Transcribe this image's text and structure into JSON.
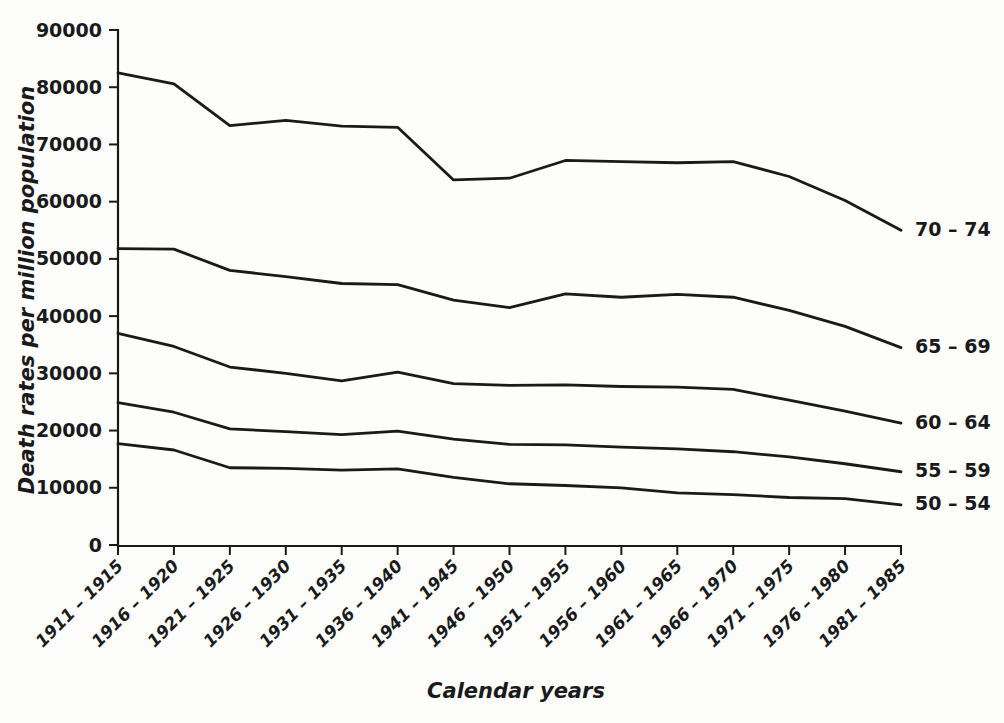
{
  "chart_data": {
    "type": "line",
    "title": "",
    "xlabel": "Calendar years",
    "ylabel": "Death rates per million population",
    "categories": [
      "1911 – 1915",
      "1916 – 1920",
      "1921 – 1925",
      "1926 – 1930",
      "1931 – 1935",
      "1936 – 1940",
      "1941 – 1945",
      "1946 – 1950",
      "1951 – 1955",
      "1956 – 1960",
      "1961 – 1965",
      "1966 – 1970",
      "1971 – 1975",
      "1976 – 1980",
      "1981 – 1985"
    ],
    "ylim": [
      0,
      90000
    ],
    "yticks": [
      0,
      10000,
      20000,
      30000,
      40000,
      50000,
      60000,
      70000,
      80000,
      90000
    ],
    "ytick_labels": [
      "0",
      "10000",
      "20000",
      "30000",
      "40000",
      "50000",
      "60000",
      "70000",
      "80000",
      "90000"
    ],
    "grid": false,
    "legend_position": "right-inline-end-of-line",
    "line_color": "#1a1a1a",
    "series": [
      {
        "name": "70 – 74",
        "values": [
          82500,
          80600,
          73300,
          74200,
          73200,
          73000,
          63800,
          64100,
          67200,
          67000,
          66800,
          67000,
          64400,
          60200,
          55000
        ]
      },
      {
        "name": "65 – 69",
        "values": [
          51800,
          51700,
          48000,
          46900,
          45700,
          45500,
          42800,
          41500,
          43900,
          43300,
          43800,
          43300,
          41000,
          38200,
          34500
        ]
      },
      {
        "name": "60 – 64",
        "values": [
          37000,
          34700,
          31100,
          30000,
          28700,
          30200,
          28200,
          27900,
          28000,
          27700,
          27600,
          27200,
          25300,
          23400,
          21300
        ]
      },
      {
        "name": "55 – 59",
        "values": [
          24900,
          23200,
          20300,
          19800,
          19300,
          19900,
          18500,
          17600,
          17500,
          17100,
          16800,
          16300,
          15400,
          14200,
          12800
        ]
      },
      {
        "name": "50 – 54",
        "values": [
          17700,
          16600,
          13500,
          13400,
          13100,
          13300,
          11800,
          10700,
          10400,
          10000,
          9100,
          8800,
          8300,
          8100,
          7000
        ]
      }
    ]
  }
}
